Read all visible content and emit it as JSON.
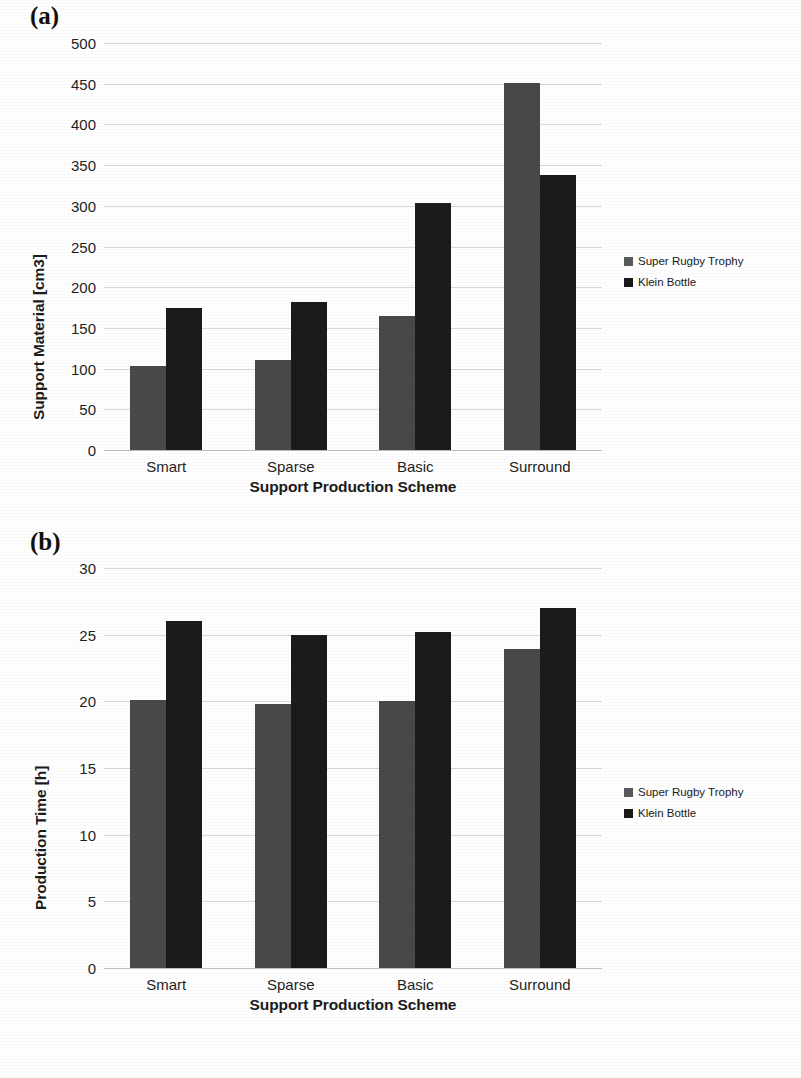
{
  "figure": {
    "panel_a_label": "(a)",
    "panel_b_label": "(b)"
  },
  "legend": {
    "series": [
      {
        "label": "Super Rugby Trophy",
        "color": "#5a5a5a"
      },
      {
        "label": "Klein Bottle",
        "color": "#1b1b1b"
      }
    ]
  },
  "chart_data": [
    {
      "type": "bar",
      "panel": "(a)",
      "title": "",
      "xlabel": "Support Production Scheme",
      "ylabel": "Support Material [cm3]",
      "categories": [
        "Smart",
        "Sparse",
        "Basic",
        "Surround"
      ],
      "series": [
        {
          "name": "Super Rugby Trophy",
          "color": "#494949",
          "values": [
            103,
            110,
            165,
            451
          ]
        },
        {
          "name": "Klein Bottle",
          "color": "#1b1b1b",
          "values": [
            174,
            182,
            304,
            338
          ]
        }
      ],
      "ylim": [
        0,
        500
      ],
      "yticks": [
        0,
        50,
        100,
        150,
        200,
        250,
        300,
        350,
        400,
        450,
        500
      ],
      "ytick_labels": [
        "0",
        "50",
        "100",
        "150",
        "200",
        "250",
        "300",
        "350",
        "400",
        "450",
        "500"
      ],
      "grid": true,
      "legend_position": "right"
    },
    {
      "type": "bar",
      "panel": "(b)",
      "title": "",
      "xlabel": "Support Production Scheme",
      "ylabel": "Production Time [h]",
      "categories": [
        "Smart",
        "Sparse",
        "Basic",
        "Surround"
      ],
      "series": [
        {
          "name": "Super Rugby Trophy",
          "color": "#494949",
          "values": [
            20.1,
            19.8,
            20.0,
            23.9
          ]
        },
        {
          "name": "Klein Bottle",
          "color": "#1b1b1b",
          "values": [
            26.0,
            25.0,
            25.2,
            27.0
          ]
        }
      ],
      "ylim": [
        0,
        30
      ],
      "yticks": [
        0,
        5,
        10,
        15,
        20,
        25,
        30
      ],
      "ytick_labels": [
        "0",
        "5",
        "10",
        "15",
        "20",
        "25",
        "30"
      ],
      "grid": true,
      "legend_position": "right"
    }
  ]
}
